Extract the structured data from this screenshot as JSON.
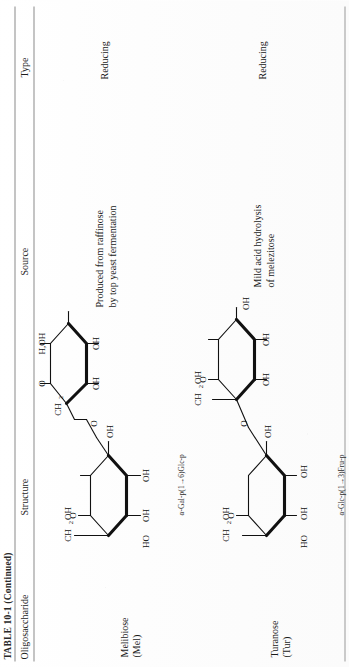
{
  "table": {
    "title": "TABLE 10-1 (Continued)",
    "columns": [
      "Oligosaccharide",
      "Structure",
      "Source",
      "Type"
    ],
    "rows": [
      {
        "name": "Melibiose",
        "abbrev": "(Mel)",
        "nomenclature": "α-Gal-p(1→6)Glc-p",
        "source_line1": "Produced from raffinose",
        "source_line2": "by top yeast fermentation",
        "type": "Reducing",
        "structure_labels": {
          "ring1_ch2oh": "CH₂OH",
          "ring1_ring_o": "O",
          "ring1_oh_left": "HO",
          "ring1_oh_bottom": "OH",
          "ring1_oh_right": "OH",
          "linker_ch2": "CH₂",
          "linker_o": "O",
          "ring2_ring_o": "O",
          "ring2_h_oh": "H,OH",
          "ring2_oh_right": "OH",
          "ring2_oh_mid": "OH",
          "ring2_oh_left": "HO"
        }
      },
      {
        "name": "Turanose",
        "abbrev": "(Tur)",
        "nomenclature": "α-Glc-p(1→3)Fru-p",
        "source_line1": "Mild acid hydrolysis",
        "source_line2": "of melezitose",
        "type": "Reducing",
        "structure_labels": {
          "ring1_ch2oh": "CH₂OH",
          "ring1_ring_o": "O",
          "ring1_oh_a": "OH",
          "ring1_oh_b": "OH",
          "ring1_oh_right": "OH",
          "ring2_ch2oh": "CH₂OH",
          "ring2_ring_o": "O",
          "ring2_oh_mid": "OH",
          "ring2_oh_left": "HO",
          "ring2_oh_right": "OH"
        }
      }
    ]
  }
}
